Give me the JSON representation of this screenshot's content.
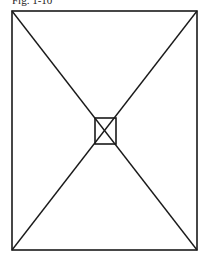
{
  "figure": {
    "caption": "Fig. 1-10",
    "stroke_color": "#1a1a1a",
    "outer_rect": {
      "x1": 12,
      "y1": 11,
      "x2": 197,
      "y2": 250
    },
    "inner_rect": {
      "x1": 95,
      "y1": 118,
      "x2": 116,
      "y2": 144
    }
  }
}
